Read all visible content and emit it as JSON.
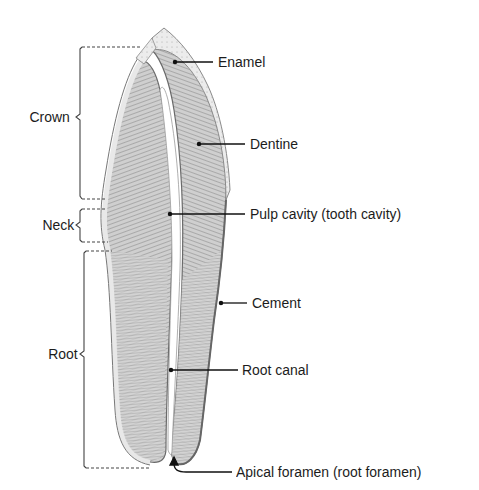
{
  "diagram": {
    "regions": [
      {
        "id": "crown",
        "label": "Crown"
      },
      {
        "id": "neck",
        "label": "Neck"
      },
      {
        "id": "root",
        "label": "Root"
      }
    ],
    "structures": [
      {
        "id": "enamel",
        "label": "Enamel"
      },
      {
        "id": "dentine",
        "label": "Dentine"
      },
      {
        "id": "pulp",
        "label": "Pulp cavity (tooth cavity)"
      },
      {
        "id": "cement",
        "label": "Cement"
      },
      {
        "id": "root-canal",
        "label": "Root canal"
      },
      {
        "id": "apical-foramen",
        "label": "Apical foramen (root foramen)"
      }
    ]
  }
}
